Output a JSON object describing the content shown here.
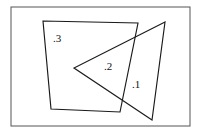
{
  "figure": {
    "width": 201,
    "height": 138,
    "background_color": "#ffffff",
    "frame": {
      "x": 11,
      "y": 7,
      "width": 179,
      "height": 119,
      "stroke_color": "#555555"
    },
    "shapes": {
      "quadrilateral": {
        "name": "quadrilateral",
        "points": "43,21 138,23 120,112 51,109",
        "stroke_color": "#1a1a1a"
      },
      "triangle": {
        "name": "triangle",
        "points": "165,22 74,68 152,120",
        "stroke_color": "#1a1a1a"
      }
    },
    "labels": [
      {
        "text": ".3",
        "x": 53,
        "y": 34,
        "region": "quadrilateral-only"
      },
      {
        "text": ".2",
        "x": 104,
        "y": 62,
        "region": "intersection"
      },
      {
        "text": ".1",
        "x": 132,
        "y": 80,
        "region": "triangle-only"
      }
    ]
  }
}
